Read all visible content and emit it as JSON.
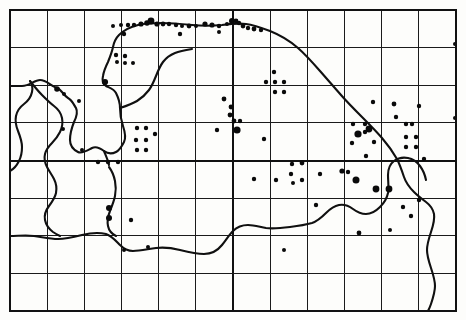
{
  "figure": {
    "kind": "species-distribution-dot-map",
    "region_outline_name": "coastline-and-county-boundary",
    "background_color": "#fdfdfb",
    "ink_color": "#0a0a0a",
    "grid_color": "#1b1b1b",
    "width": 466,
    "height": 320,
    "caption": "",
    "title": "",
    "legend": []
  },
  "chart_data": {
    "type": "scatter",
    "title": "",
    "subtitle": "",
    "xlabel": "",
    "ylabel": "",
    "grid": true,
    "legend_position": "none",
    "xlim": [
      10,
      456
    ],
    "ylim": [
      10,
      311
    ],
    "grid_frame": {
      "x0": 10,
      "y0": 10,
      "x1": 456,
      "y1": 311,
      "columns": 12,
      "rows": 8,
      "cell_width": 37.17,
      "cell_height": 37.63,
      "major_vertical_x": 233,
      "major_horizontal_y": 160.5,
      "vertical_lines": [
        10,
        47.2,
        84.3,
        121.5,
        158.7,
        195.8,
        233,
        270.2,
        307.3,
        344.5,
        381.7,
        418.8,
        456
      ],
      "horizontal_lines": [
        10,
        47.6,
        85.3,
        122.9,
        160.5,
        198.1,
        235.8,
        273.4,
        311
      ]
    },
    "series": [
      {
        "name": "records",
        "marker": "filled-circle",
        "color": "#0a0a0a",
        "points": [
          {
            "x": 113,
            "y": 26,
            "r": 2.0
          },
          {
            "x": 121,
            "y": 25,
            "r": 2.0
          },
          {
            "x": 128,
            "y": 25,
            "r": 2.2
          },
          {
            "x": 134,
            "y": 25,
            "r": 2.2
          },
          {
            "x": 141,
            "y": 24,
            "r": 2.6
          },
          {
            "x": 147,
            "y": 23,
            "r": 2.8
          },
          {
            "x": 151,
            "y": 21,
            "r": 3.4
          },
          {
            "x": 157,
            "y": 24,
            "r": 2.6
          },
          {
            "x": 163,
            "y": 24,
            "r": 2.4
          },
          {
            "x": 169,
            "y": 24,
            "r": 2.2
          },
          {
            "x": 176,
            "y": 25,
            "r": 2.2
          },
          {
            "x": 182,
            "y": 26,
            "r": 2.0
          },
          {
            "x": 189,
            "y": 26,
            "r": 2.4
          },
          {
            "x": 196,
            "y": 26,
            "r": 2.0
          },
          {
            "x": 205,
            "y": 24,
            "r": 2.6
          },
          {
            "x": 212,
            "y": 25,
            "r": 2.6
          },
          {
            "x": 219,
            "y": 26,
            "r": 2.2
          },
          {
            "x": 227,
            "y": 24,
            "r": 2.0
          },
          {
            "x": 232,
            "y": 21,
            "r": 3.0
          },
          {
            "x": 236,
            "y": 21,
            "r": 2.4
          },
          {
            "x": 239,
            "y": 23,
            "r": 2.2
          },
          {
            "x": 243,
            "y": 26,
            "r": 2.4
          },
          {
            "x": 248,
            "y": 28,
            "r": 2.2
          },
          {
            "x": 254,
            "y": 29,
            "r": 2.4
          },
          {
            "x": 261,
            "y": 30,
            "r": 2.2
          },
          {
            "x": 124,
            "y": 34,
            "r": 2.2
          },
          {
            "x": 180,
            "y": 34,
            "r": 2.2
          },
          {
            "x": 219,
            "y": 32,
            "r": 2.0
          },
          {
            "x": 57,
            "y": 89,
            "r": 2.8
          },
          {
            "x": 64,
            "y": 94,
            "r": 2.0
          },
          {
            "x": 79,
            "y": 101,
            "r": 2.0
          },
          {
            "x": 105,
            "y": 82,
            "r": 3.1
          },
          {
            "x": 116,
            "y": 55,
            "r": 2.2
          },
          {
            "x": 117,
            "y": 62,
            "r": 2.0
          },
          {
            "x": 125,
            "y": 56,
            "r": 2.2
          },
          {
            "x": 125,
            "y": 63,
            "r": 2.0
          },
          {
            "x": 133,
            "y": 63,
            "r": 2.0
          },
          {
            "x": 137,
            "y": 128,
            "r": 2.2
          },
          {
            "x": 136,
            "y": 140,
            "r": 2.2
          },
          {
            "x": 146,
            "y": 128,
            "r": 2.2
          },
          {
            "x": 146,
            "y": 140,
            "r": 2.2
          },
          {
            "x": 155,
            "y": 134,
            "r": 2.2
          },
          {
            "x": 137,
            "y": 150,
            "r": 2.2
          },
          {
            "x": 146,
            "y": 150,
            "r": 2.2
          },
          {
            "x": 82,
            "y": 150,
            "r": 2.0
          },
          {
            "x": 98,
            "y": 162,
            "r": 2.2
          },
          {
            "x": 108,
            "y": 162,
            "r": 2.2
          },
          {
            "x": 118,
            "y": 162,
            "r": 2.2
          },
          {
            "x": 109,
            "y": 208,
            "r": 3.0
          },
          {
            "x": 109,
            "y": 218,
            "r": 3.0
          },
          {
            "x": 131,
            "y": 220,
            "r": 2.2
          },
          {
            "x": 124,
            "y": 250,
            "r": 2.0
          },
          {
            "x": 224,
            "y": 99,
            "r": 2.4
          },
          {
            "x": 231,
            "y": 107,
            "r": 2.4
          },
          {
            "x": 230,
            "y": 115,
            "r": 2.4
          },
          {
            "x": 234,
            "y": 121,
            "r": 2.4
          },
          {
            "x": 240,
            "y": 121,
            "r": 2.2
          },
          {
            "x": 237,
            "y": 130,
            "r": 3.6
          },
          {
            "x": 217,
            "y": 130,
            "r": 2.2
          },
          {
            "x": 264,
            "y": 139,
            "r": 2.2
          },
          {
            "x": 274,
            "y": 72,
            "r": 2.2
          },
          {
            "x": 266,
            "y": 82,
            "r": 2.2
          },
          {
            "x": 275,
            "y": 82,
            "r": 2.2
          },
          {
            "x": 284,
            "y": 82,
            "r": 2.2
          },
          {
            "x": 275,
            "y": 92,
            "r": 2.2
          },
          {
            "x": 284,
            "y": 92,
            "r": 2.2
          },
          {
            "x": 254,
            "y": 179,
            "r": 2.2
          },
          {
            "x": 276,
            "y": 180,
            "r": 2.2
          },
          {
            "x": 291,
            "y": 174,
            "r": 2.2
          },
          {
            "x": 292,
            "y": 164,
            "r": 2.2
          },
          {
            "x": 302,
            "y": 163,
            "r": 2.4
          },
          {
            "x": 293,
            "y": 183,
            "r": 2.0
          },
          {
            "x": 302,
            "y": 180,
            "r": 2.2
          },
          {
            "x": 320,
            "y": 174,
            "r": 2.2
          },
          {
            "x": 316,
            "y": 205,
            "r": 2.2
          },
          {
            "x": 342,
            "y": 171,
            "r": 2.6
          },
          {
            "x": 356,
            "y": 180,
            "r": 3.5
          },
          {
            "x": 376,
            "y": 189,
            "r": 3.4
          },
          {
            "x": 389,
            "y": 189,
            "r": 3.4
          },
          {
            "x": 366,
            "y": 156,
            "r": 2.2
          },
          {
            "x": 373,
            "y": 102,
            "r": 2.2
          },
          {
            "x": 369,
            "y": 129,
            "r": 3.4
          },
          {
            "x": 358,
            "y": 134,
            "r": 3.6
          },
          {
            "x": 365,
            "y": 132,
            "r": 2.2
          },
          {
            "x": 353,
            "y": 124,
            "r": 2.2
          },
          {
            "x": 365,
            "y": 124,
            "r": 2.2
          },
          {
            "x": 352,
            "y": 143,
            "r": 2.2
          },
          {
            "x": 374,
            "y": 142,
            "r": 2.2
          },
          {
            "x": 348,
            "y": 172,
            "r": 2.2
          },
          {
            "x": 396,
            "y": 117,
            "r": 2.2
          },
          {
            "x": 394,
            "y": 104,
            "r": 2.4
          },
          {
            "x": 406,
            "y": 124,
            "r": 2.2
          },
          {
            "x": 412,
            "y": 124,
            "r": 2.2
          },
          {
            "x": 406,
            "y": 137,
            "r": 2.2
          },
          {
            "x": 416,
            "y": 137,
            "r": 2.2
          },
          {
            "x": 406,
            "y": 147,
            "r": 2.2
          },
          {
            "x": 416,
            "y": 147,
            "r": 2.2
          },
          {
            "x": 419,
            "y": 106,
            "r": 2.2
          },
          {
            "x": 424,
            "y": 159,
            "r": 2.2
          },
          {
            "x": 359,
            "y": 233,
            "r": 2.4
          },
          {
            "x": 411,
            "y": 216,
            "r": 2.2
          },
          {
            "x": 403,
            "y": 207,
            "r": 2.2
          },
          {
            "x": 419,
            "y": 200,
            "r": 2.2
          },
          {
            "x": 390,
            "y": 230,
            "r": 2.0
          },
          {
            "x": 284,
            "y": 250,
            "r": 2.0
          },
          {
            "x": 148,
            "y": 247,
            "r": 2.0
          },
          {
            "x": 63,
            "y": 129,
            "r": 2.0
          },
          {
            "x": 455,
            "y": 44,
            "r": 2.0
          },
          {
            "x": 455,
            "y": 118,
            "r": 2.0
          }
        ]
      }
    ]
  },
  "geometry": {
    "coast_paths": [
      "M 10,86 L 22,86 C 30,86 34,80 40,80 C 47,80 50,86 57,88 C 62,90 64,96 68,98 C 72,100 74,105 76,108 C 78,112 76,118 74,122 C 72,127 70,133 70,140 C 70,146 74,150 78,152 C 82,154 88,150 92,148 C 96,146 100,148 104,151 C 108,154 112,154 116,152 C 120,150 122,146 124,142 C 126,138 125,132 123,126 C 121,120 120,114 120,108 C 120,102 118,97 116,93 C 114,89 110,88 106,86 C 103,84 102,80 103,76 C 104,70 106,66 108,62 C 110,57 112,52 113,47 C 114,42 116,38 119,35 C 124,30 130,27 138,25 C 146,23 154,23 162,23 C 172,23 182,24 192,25 C 202,26 212,26 222,25 C 230,24 238,23 246,24 C 254,25 262,28 270,31 C 280,35 290,41 298,48 C 306,55 313,63 320,71 C 327,79 334,87 341,95 C 348,103 355,110 362,117 C 369,124 376,131 382,138 C 388,145 393,152 397,159 C 400,165 402,171 404,177 C 406,183 410,188 414,192 C 418,196 422,199 426,202 C 430,205 433,209 434,214 C 435,220 433,226 431,232 C 429,238 427,244 427,250 C 427,256 429,262 431,268 C 433,274 435,280 435,286 C 435,292 433,298 431,304 C 430,307 429,309 428,311",
      "M 10,236 C 18,236 26,235 34,236 C 42,237 50,239 58,239 C 66,239 74,237 82,235 C 90,233 98,232 106,234 C 112,236 116,241 120,245 C 124,249 128,251 133,251 C 140,251 148,249 156,248 C 164,247 172,248 180,250 C 188,252 196,254 204,254 C 212,254 218,250 222,245 C 226,240 229,235 233,231 C 237,227 242,225 248,225 C 254,225 260,227 266,228 C 274,229 282,228 290,227 C 298,226 305,225 312,223 C 318,221 322,217 326,213 C 330,209 334,206 339,205 C 344,204 349,206 353,209 C 357,212 361,214 366,214 C 371,214 376,211 380,207 C 384,203 387,198 388,193 C 389,187 388,181 388,175 C 388,169 390,164 394,161 C 398,158 403,157 408,158 C 413,159 417,162 420,166 C 423,170 425,175 426,180",
      "M 10,171 C 14,169 17,165 19,161 C 21,157 22,152 22,147 C 22,141 20,136 18,131 C 16,126 15,121 16,116 C 17,111 20,107 24,104 C 28,101 31,97 32,92 C 33,88 32,84 30,81",
      "M 30,81 C 34,86 38,91 42,95 C 46,99 50,103 54,106 C 58,109 61,113 62,118 C 63,123 62,128 60,132 C 58,136 55,140 52,143 C 49,146 46,150 45,154 C 44,158 45,163 47,167 C 49,171 52,175 54,179 C 56,183 57,188 56,193 C 55,198 52,202 49,206 C 46,210 44,215 45,220 C 46,225 49,229 53,232 C 56,234 58,235 60,236",
      "M 120,108 C 126,106 132,104 137,101 C 142,98 146,94 149,90 C 152,86 154,81 156,76 C 158,71 160,66 163,62 C 166,58 170,55 175,53 C 180,51 186,50 192,49",
      "M 109,167 C 112,171 114,176 115,181 C 116,186 116,191 115,196 C 114,201 112,206 110,211 C 108,216 107,221 108,226 C 109,231 112,234 116,236",
      "M 104,151 C 106,156 108,160 109,165"
    ],
    "coast_paths_note": "Approximate vector trace of the printed coastline, estuary and inland county boundary."
  }
}
